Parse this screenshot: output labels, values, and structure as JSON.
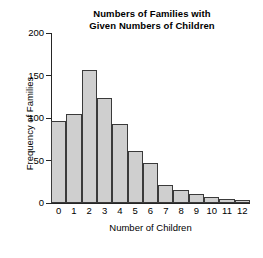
{
  "chart_data": {
    "type": "bar",
    "title": "Numbers of Families with Given Numbers of Children",
    "title_lines": [
      "Numbers of Families with",
      "Given Numbers of Children"
    ],
    "xlabel": "Number of Children",
    "ylabel": "Frequency of Families",
    "categories": [
      "0",
      "1",
      "2",
      "3",
      "4",
      "5",
      "6",
      "7",
      "8",
      "9",
      "10",
      "11",
      "12"
    ],
    "values": [
      97,
      105,
      156,
      123,
      93,
      61,
      47,
      21,
      15,
      11,
      7,
      5,
      3
    ],
    "ylim": [
      0,
      200
    ],
    "yticks": [
      0,
      50,
      100,
      150,
      200
    ],
    "ytick_labels": [
      "0",
      "50",
      "100",
      "150",
      "200"
    ],
    "xlim": [
      -0.5,
      12.5
    ],
    "grid": false,
    "legend": false,
    "legend_position": "none",
    "bar_fill_color": "#cfcfcf",
    "bar_edge_color": "#3a3a3a",
    "axis_color": "#262626",
    "background_color": "#ffffff",
    "text_color": "#000000"
  }
}
